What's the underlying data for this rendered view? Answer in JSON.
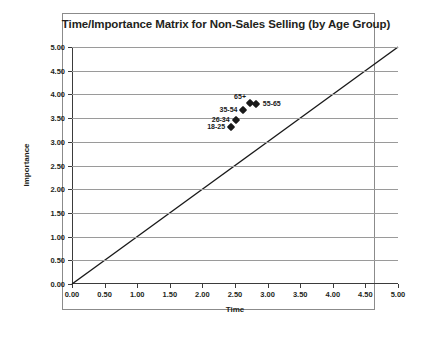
{
  "chart_data": {
    "type": "scatter",
    "title": "Time/Importance Matrix for Non-Sales Selling (by Age Group)",
    "xlabel": "Time",
    "ylabel": "Importance",
    "xlim": [
      0,
      5
    ],
    "ylim": [
      0,
      5
    ],
    "xticks": [
      "0.00",
      "0.50",
      "1.00",
      "1.50",
      "2.00",
      "2.50",
      "3.00",
      "3.50",
      "4.00",
      "4.50",
      "5.00"
    ],
    "yticks": [
      "0.00",
      "0.50",
      "1.00",
      "1.50",
      "2.00",
      "2.50",
      "3.00",
      "3.50",
      "4.00",
      "4.50",
      "5.00"
    ],
    "grid": "horizontal",
    "legend": "none",
    "reference_line": {
      "label": "y = x",
      "from": [
        0,
        0
      ],
      "to": [
        5,
        5
      ]
    },
    "points": [
      {
        "label": "65+",
        "x": 2.73,
        "y": 3.81,
        "label_pos": "above"
      },
      {
        "label": "55-65",
        "x": 2.82,
        "y": 3.79,
        "label_pos": "right"
      },
      {
        "label": "35-54",
        "x": 2.63,
        "y": 3.67,
        "label_pos": "left"
      },
      {
        "label": "26-34",
        "x": 2.51,
        "y": 3.45,
        "label_pos": "left"
      },
      {
        "label": "18-25",
        "x": 2.44,
        "y": 3.32,
        "label_pos": "left"
      }
    ]
  }
}
